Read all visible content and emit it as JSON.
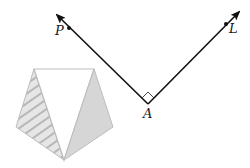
{
  "diagram": {
    "labels": {
      "p": "P",
      "l": "L",
      "a": "A"
    },
    "colors": {
      "ray": "#111111",
      "shape_outline": "#bdbdbd",
      "shaded_fill": "#d6d6d6",
      "hatch_bg": "#e6e6e6",
      "hatch_line": "#ababab",
      "center_fill": "#ffffff"
    },
    "rays": [
      {
        "name": "ray-AP",
        "from": [
          148,
          104
        ],
        "to": [
          56,
          14
        ],
        "point_label": "P",
        "point": [
          69,
          28
        ]
      },
      {
        "name": "ray-AL",
        "from": [
          148,
          104
        ],
        "to": [
          240,
          11
        ],
        "point_label": "L",
        "point": [
          226,
          24
        ]
      }
    ],
    "right_angle_at": "A",
    "pentagon": {
      "vertices": [
        [
          34,
          69
        ],
        [
          94,
          69
        ],
        [
          113,
          127
        ],
        [
          64,
          160
        ],
        [
          16,
          127
        ]
      ],
      "regions": [
        {
          "name": "left-triangle",
          "fill": "hatched"
        },
        {
          "name": "center-triangle",
          "fill": "white"
        },
        {
          "name": "right-triangle",
          "fill": "shaded"
        }
      ]
    }
  }
}
